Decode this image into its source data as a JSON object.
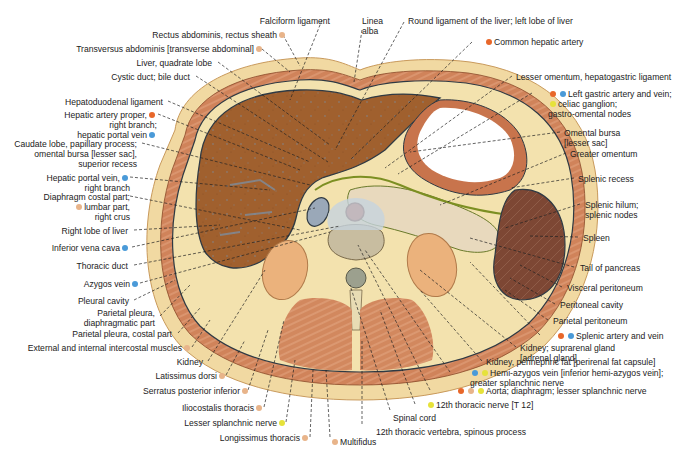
{
  "figure": {
    "colors": {
      "artery": "#e8672a",
      "vein": "#4a9ad8",
      "nerve": "#e6e23a",
      "muscle": "#e8b48a",
      "skin": "#f0d9a0",
      "liver": "#9a5a2a",
      "spleen": "#7a4632",
      "kidney": "#eab27a",
      "fat": "#f5e3b0",
      "lumen": "#ffffff",
      "vertebra": "#d9d0bc"
    }
  },
  "labels": [
    {
      "id": "falciform",
      "text": "Falciform ligament",
      "x": 330,
      "y": 16,
      "align": "r",
      "dots": [],
      "lx": 322,
      "ly": 20,
      "tx": 290,
      "ty": 100
    },
    {
      "id": "linea-alba",
      "text": "Linea\nalba",
      "x": 362,
      "y": 16,
      "align": "l",
      "dots": [],
      "lx": 362,
      "ly": 30,
      "tx": 354,
      "ty": 82
    },
    {
      "id": "round-lig",
      "text": "Round ligament of the liver; left lobe of liver",
      "x": 408,
      "y": 16,
      "align": "l",
      "dots": [],
      "lx": 404,
      "ly": 22,
      "tx": 335,
      "ty": 150
    },
    {
      "id": "rectus",
      "text": "Rectus abdominis, rectus sheath",
      "x": 275,
      "y": 30,
      "align": "r",
      "dots": [
        "muscle"
      ],
      "lx": 283,
      "ly": 35,
      "tx": 300,
      "ty": 66
    },
    {
      "id": "common-hepatic",
      "text": "Common hepatic artery",
      "x": 484,
      "y": 37,
      "align": "l",
      "dots": [
        "artery"
      ],
      "dotsBefore": true,
      "lx": 472,
      "ly": 42,
      "tx": 350,
      "ty": 160
    },
    {
      "id": "transversus",
      "text": "Transversus abdominis [transverse abdominal]",
      "x": 252,
      "y": 44,
      "align": "r",
      "dots": [
        "muscle"
      ],
      "lx": 262,
      "ly": 49,
      "tx": 290,
      "ty": 72
    },
    {
      "id": "quadrate",
      "text": "Liver, quadrate lobe",
      "x": 212,
      "y": 58,
      "align": "r",
      "dots": [],
      "lx": 218,
      "ly": 62,
      "tx": 330,
      "ty": 145
    },
    {
      "id": "cystic",
      "text": "Cystic duct; bile duct",
      "x": 190,
      "y": 72,
      "align": "r",
      "dots": [],
      "lx": 196,
      "ly": 76,
      "tx": 328,
      "ty": 162
    },
    {
      "id": "lesser-omentum",
      "text": "Lesser omentum, hepatogastric ligament",
      "x": 516,
      "y": 72,
      "align": "l",
      "dots": [],
      "lx": 512,
      "ly": 76,
      "tx": 385,
      "ty": 168
    },
    {
      "id": "left-gastric",
      "text": "Left gastric artery and vein;\nceliac ganglion;\ngastro-omental nodes",
      "x": 548,
      "y": 89,
      "align": "l",
      "dots": [
        "artery",
        "vein"
      ],
      "dotsBefore": true,
      "extraDot": "nerve",
      "lx": 532,
      "ly": 93,
      "tx": 398,
      "ty": 174
    },
    {
      "id": "hepatoduodenal",
      "text": "Hepatoduodenal ligament",
      "x": 163,
      "y": 97,
      "align": "r",
      "dots": [],
      "lx": 168,
      "ly": 101,
      "tx": 310,
      "ty": 162
    },
    {
      "id": "hepatic-artery-proper",
      "text": "Hepatic artery proper,\nright branch;\nhepatic portal vein",
      "x": 145,
      "y": 110,
      "align": "r",
      "dots": [
        "artery"
      ],
      "dots3": [
        "vein"
      ],
      "lx": 158,
      "ly": 114,
      "tx": 300,
      "ty": 170
    },
    {
      "id": "omental-bursa",
      "text": "Omental bursa\n[lesser sac]",
      "x": 564,
      "y": 128,
      "align": "l",
      "dots": [],
      "lx": 560,
      "ly": 132,
      "tx": 410,
      "ty": 152
    },
    {
      "id": "greater-omentum",
      "text": "Greater omentum",
      "x": 570,
      "y": 149,
      "align": "l",
      "dots": [],
      "lx": 566,
      "ly": 153,
      "tx": 440,
      "ty": 205
    },
    {
      "id": "caudate",
      "text": "Caudate lobe, papillary process;\nomental bursa [lesser sac],\nsuperior recess",
      "x": 137,
      "y": 139,
      "align": "r",
      "dots": [],
      "lx": 142,
      "ly": 143,
      "tx": 310,
      "ty": 185
    },
    {
      "id": "portal-right",
      "text": "Hepatic portal vein,\nright branch",
      "x": 118,
      "y": 173,
      "align": "r",
      "dots": [
        "vein"
      ],
      "lx": 130,
      "ly": 177,
      "tx": 270,
      "ty": 190
    },
    {
      "id": "splenic-recess",
      "text": "Splenic recess",
      "x": 578,
      "y": 174,
      "align": "l",
      "dots": [],
      "lx": 574,
      "ly": 178,
      "tx": 510,
      "ty": 188
    },
    {
      "id": "diaphragm-costal",
      "text": "Diaphragm costal part;\nlumbar part,\nright crus",
      "x": 118,
      "y": 192,
      "align": "r",
      "dots": [
        "muscle"
      ],
      "dotsLine2": true,
      "lx": 130,
      "ly": 196,
      "tx": 300,
      "ty": 230
    },
    {
      "id": "splenic-hilum",
      "text": "Splenic hilum;\nsplenic nodes",
      "x": 585,
      "y": 200,
      "align": "l",
      "dots": [],
      "lx": 580,
      "ly": 204,
      "tx": 505,
      "ty": 228
    },
    {
      "id": "right-lobe",
      "text": "Right lobe of liver",
      "x": 128,
      "y": 226,
      "align": "r",
      "dots": [],
      "lx": 134,
      "ly": 230,
      "tx": 220,
      "ty": 225
    },
    {
      "id": "spleen",
      "text": "Spleen",
      "x": 583,
      "y": 233,
      "align": "l",
      "dots": [],
      "lx": 578,
      "ly": 237,
      "tx": 530,
      "ty": 236
    },
    {
      "id": "ivc",
      "text": "Inferior vena cava",
      "x": 118,
      "y": 243,
      "align": "r",
      "dots": [
        "vein"
      ],
      "lx": 132,
      "ly": 247,
      "tx": 315,
      "ty": 208
    },
    {
      "id": "tail-pancreas",
      "text": "Tail of pancreas",
      "x": 580,
      "y": 263,
      "align": "l",
      "dots": [],
      "lx": 574,
      "ly": 267,
      "tx": 470,
      "ty": 238
    },
    {
      "id": "thoracic-duct",
      "text": "Thoracic duct",
      "x": 128,
      "y": 261,
      "align": "r",
      "dots": [],
      "lx": 134,
      "ly": 265,
      "tx": 340,
      "ty": 226
    },
    {
      "id": "azygos",
      "text": "Azygos vein",
      "x": 128,
      "y": 279,
      "align": "r",
      "dots": [
        "vein"
      ],
      "lx": 140,
      "ly": 283,
      "tx": 330,
      "ty": 232
    },
    {
      "id": "visceral-peritoneum",
      "text": "Visceral peritoneum",
      "x": 567,
      "y": 283,
      "align": "l",
      "dots": [],
      "lx": 562,
      "ly": 287,
      "tx": 520,
      "ty": 265
    },
    {
      "id": "pleural-cavity",
      "text": "Pleural cavity",
      "x": 129,
      "y": 296,
      "align": "r",
      "dots": [],
      "lx": 134,
      "ly": 300,
      "tx": 175,
      "ty": 280
    },
    {
      "id": "peritoneal-cavity",
      "text": "Peritoneal cavity",
      "x": 560,
      "y": 300,
      "align": "l",
      "dots": [],
      "lx": 555,
      "ly": 304,
      "tx": 510,
      "ty": 278
    },
    {
      "id": "parietal-pleura-diaph",
      "text": "Parietal pleura,\ndiaphragmatic part",
      "x": 155,
      "y": 308,
      "align": "r",
      "dots": [],
      "lx": 160,
      "ly": 316,
      "tx": 190,
      "ty": 285
    },
    {
      "id": "parietal-peritoneum",
      "text": "Parietal peritoneum",
      "x": 553,
      "y": 316,
      "align": "l",
      "dots": [],
      "lx": 548,
      "ly": 320,
      "tx": 505,
      "ty": 290
    },
    {
      "id": "parietal-pleura-costal",
      "text": "Parietal pleura, costal part",
      "x": 172,
      "y": 329,
      "align": "r",
      "dots": [],
      "lx": 178,
      "ly": 333,
      "tx": 200,
      "ty": 308
    },
    {
      "id": "splenic-av",
      "text": "Splenic artery and vein",
      "x": 556,
      "y": 331,
      "align": "l",
      "dots": [
        "artery",
        "vein"
      ],
      "dotsBefore": true,
      "lx": 540,
      "ly": 335,
      "tx": 470,
      "ty": 262
    },
    {
      "id": "intercostal",
      "text": "External and internal intercostal muscles",
      "x": 180,
      "y": 343,
      "align": "r",
      "dots": [
        "muscle"
      ],
      "lx": 192,
      "ly": 347,
      "tx": 210,
      "ty": 320
    },
    {
      "id": "kidney-suprarenal",
      "text": "Kidney; suprarenal gland\n[adrenal gland]",
      "x": 520,
      "y": 343,
      "align": "l",
      "dots": [],
      "lx": 516,
      "ly": 347,
      "tx": 420,
      "ty": 270
    },
    {
      "id": "kidney-left",
      "text": "Kidney",
      "x": 203,
      "y": 357,
      "align": "r",
      "dots": [],
      "lx": 208,
      "ly": 361,
      "tx": 265,
      "ty": 270
    },
    {
      "id": "perinephric",
      "text": "Kidney, perinephric fat [perirenal fat capsule]",
      "x": 486,
      "y": 357,
      "align": "l",
      "dots": [],
      "lx": 482,
      "ly": 361,
      "tx": 420,
      "ty": 290
    },
    {
      "id": "latissimus",
      "text": "Latissimus dorsi",
      "x": 215,
      "y": 371,
      "align": "r",
      "dots": [
        "muscle"
      ],
      "lx": 226,
      "ly": 375,
      "tx": 245,
      "ty": 340
    },
    {
      "id": "hemiazygos",
      "text": "Hemi-azygos vein [inferior hemi-azygos vein];\ngreater splanchnic nerve",
      "x": 470,
      "y": 368,
      "align": "l",
      "dots": [
        "vein",
        "nerve"
      ],
      "dotsBefore": true,
      "lx": 450,
      "ly": 372,
      "tx": 365,
      "ty": 250
    },
    {
      "id": "aorta",
      "text": "Aorta; diaphragm; lesser splanchnic nerve",
      "x": 456,
      "y": 386,
      "align": "l",
      "dots": [
        "artery",
        "muscle",
        "nerve"
      ],
      "dotsBefore": true,
      "lx": 430,
      "ly": 390,
      "tx": 358,
      "ty": 245
    },
    {
      "id": "serratus",
      "text": "Serratus posterior inferior",
      "x": 238,
      "y": 386,
      "align": "r",
      "dots": [
        "muscle"
      ],
      "lx": 248,
      "ly": 390,
      "tx": 268,
      "ty": 330
    },
    {
      "id": "t12-nerve",
      "text": "12th thoracic nerve [T 12]",
      "x": 426,
      "y": 400,
      "align": "l",
      "dots": [
        "nerve"
      ],
      "dotsBefore": true,
      "lx": 415,
      "ly": 404,
      "tx": 380,
      "ty": 310
    },
    {
      "id": "iliocostalis",
      "text": "Iliocostalis thoracis",
      "x": 252,
      "y": 403,
      "align": "r",
      "dots": [
        "muscle"
      ],
      "lx": 264,
      "ly": 407,
      "tx": 284,
      "ty": 320
    },
    {
      "id": "spinal-cord",
      "text": "Spinal cord",
      "x": 393,
      "y": 413,
      "align": "l",
      "dots": [],
      "lx": 390,
      "ly": 410,
      "tx": 350,
      "ty": 285
    },
    {
      "id": "lesser-splanchnic",
      "text": "Lesser splanchnic nerve",
      "x": 275,
      "y": 418,
      "align": "r",
      "dots": [
        "nerve"
      ],
      "lx": 286,
      "ly": 422,
      "tx": 295,
      "ty": 360
    },
    {
      "id": "t12-vertebra",
      "text": "12th thoracic vertebra, spinous process",
      "x": 376,
      "y": 427,
      "align": "l",
      "dots": [],
      "lx": 362,
      "ly": 424,
      "tx": 362,
      "ty": 340
    },
    {
      "id": "longissimus",
      "text": "Longissimus thoracis",
      "x": 298,
      "y": 433,
      "align": "r",
      "dots": [
        "muscle"
      ],
      "lx": 310,
      "ly": 437,
      "tx": 313,
      "ty": 370
    },
    {
      "id": "multifidus",
      "text": "Multifidus",
      "x": 330,
      "y": 437,
      "align": "l",
      "dots": [
        "muscle"
      ],
      "dotsBefore": true,
      "lx": 330,
      "ly": 437,
      "tx": 326,
      "ty": 370
    }
  ]
}
